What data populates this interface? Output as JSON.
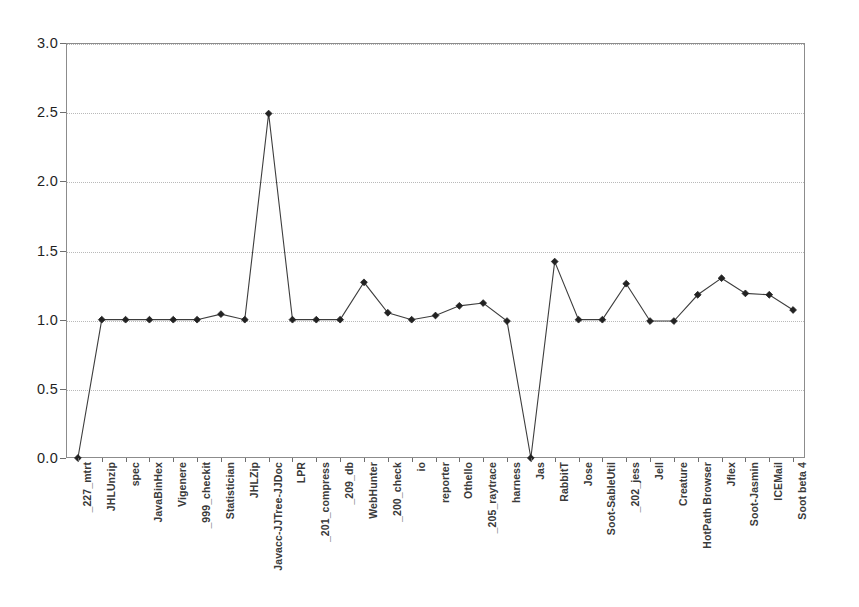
{
  "chart_data": {
    "type": "line",
    "title": "",
    "subtitle": "",
    "xlabel": "",
    "ylabel": "",
    "ylim": [
      0.0,
      3.0
    ],
    "ytick_labels": [
      "0.0",
      "0.5",
      "1.0",
      "1.5",
      "2.0",
      "2.5",
      "3.0"
    ],
    "ytick_values": [
      0.0,
      0.5,
      1.0,
      1.5,
      2.0,
      2.5,
      3.0
    ],
    "grid": true,
    "grid_axis": "y",
    "legend": false,
    "legend_position": "none",
    "marker": "diamond",
    "line_color": "#3d3d3d",
    "marker_color": "#222222",
    "categories": [
      "_227_mtrt",
      "JHLUnzip",
      "spec",
      "JavaBinHex",
      "Vigenere",
      "_999_checkit",
      "Statistician",
      "JHLZip",
      "Javacc-JJTree-JJDoc",
      "LPR",
      "_201_compress",
      "_209_db",
      "WebHunter",
      "_200_check",
      "io",
      "reporter",
      "Othello",
      "_205_raytrace",
      "harness",
      "Jas",
      "RabbitT",
      "Jose",
      "Soot-SableUtil",
      "_202_jess",
      "Jell",
      "Creature",
      "HotPath Browser",
      "Jflex",
      "Soot-Jasmin",
      "ICEMail",
      "Soot beta 4"
    ],
    "values": [
      0.0,
      1.0,
      1.0,
      1.0,
      1.0,
      1.0,
      1.04,
      1.0,
      2.49,
      1.0,
      1.0,
      1.0,
      1.27,
      1.05,
      1.0,
      1.03,
      1.1,
      1.12,
      0.99,
      0.0,
      1.42,
      1.0,
      1.0,
      1.26,
      0.99,
      0.99,
      1.18,
      1.3,
      1.19,
      1.18,
      1.07
    ]
  }
}
